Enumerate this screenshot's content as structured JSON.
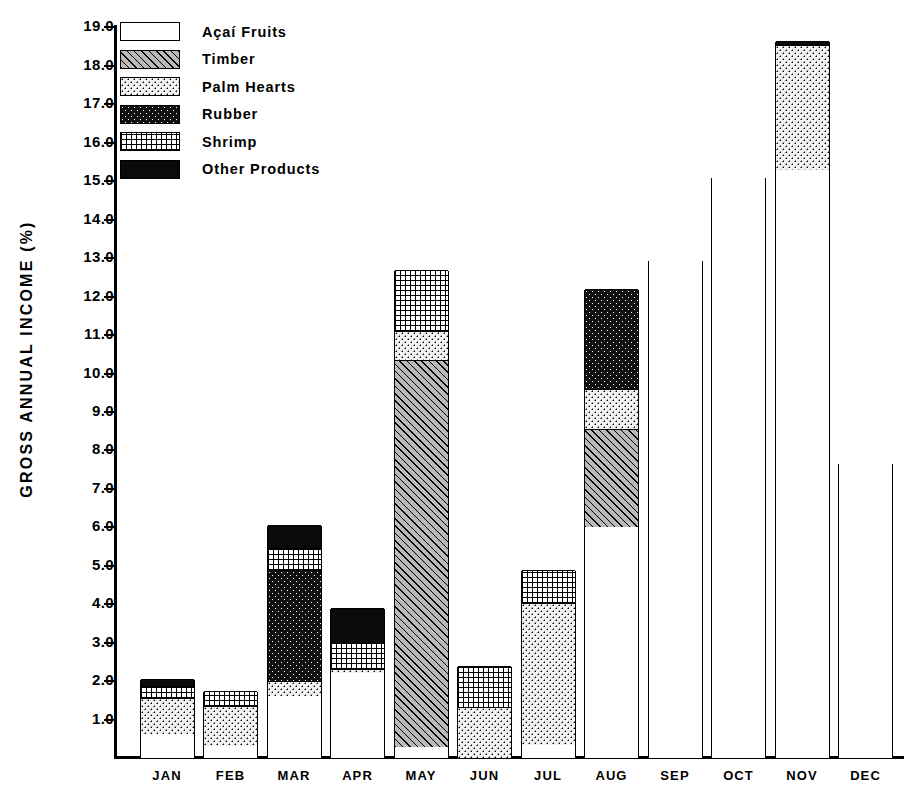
{
  "chart_data": {
    "type": "bar",
    "subtype": "stacked-bar",
    "title": "",
    "xlabel": "",
    "ylabel": "GROSS ANNUAL INCOME (%)",
    "ylim": [
      0,
      19.2
    ],
    "ytick_labels": [
      "19.0",
      "18.0",
      "17.0",
      "16.0",
      "15.0",
      "14.0",
      "13.0",
      "12.0",
      "11.0",
      "10.0",
      "9.0",
      "8.0",
      "7.0",
      "6.0",
      "5.0",
      "4.0",
      "3.0",
      "2.0",
      "1.0"
    ],
    "ytick_values": [
      19.0,
      18.0,
      17.0,
      16.0,
      15.0,
      14.0,
      13.0,
      12.0,
      11.0,
      10.0,
      9.0,
      8.0,
      7.0,
      6.0,
      5.0,
      4.0,
      3.0,
      2.0,
      1.0
    ],
    "grid": false,
    "legend_position": "upper-left-inside",
    "categories": [
      "JAN",
      "FEB",
      "MAR",
      "APR",
      "MAY",
      "JUN",
      "JUL",
      "AUG",
      "SEP",
      "OCT",
      "NOV",
      "DEC"
    ],
    "series": [
      {
        "name": "Açaí Fruits",
        "pattern": "open-white",
        "values": [
          0.62,
          0.3,
          1.6,
          2.2,
          0.28,
          0.0,
          0.35,
          6.0,
          12.95,
          15.1,
          15.3,
          7.68
        ]
      },
      {
        "name": "Timber",
        "pattern": "diagonal-hatch",
        "values": [
          0.0,
          0.0,
          0.0,
          0.0,
          10.07,
          0.0,
          0.0,
          2.55,
          0.0,
          0.0,
          0.0,
          0.0
        ]
      },
      {
        "name": "Palm Hearts",
        "pattern": "light-dots",
        "values": [
          0.95,
          1.05,
          0.4,
          0.12,
          0.75,
          1.3,
          3.67,
          1.05,
          0.0,
          0.0,
          3.25,
          0.0
        ]
      },
      {
        "name": "Rubber",
        "pattern": "dark-dots",
        "values": [
          0.0,
          0.0,
          2.9,
          0.0,
          0.0,
          0.0,
          0.0,
          2.6,
          0.0,
          0.0,
          0.0,
          0.0
        ]
      },
      {
        "name": "Shrimp",
        "pattern": "fine-grid",
        "values": [
          0.3,
          0.4,
          0.55,
          0.68,
          1.6,
          1.1,
          0.88,
          0.0,
          0.0,
          0.0,
          0.0,
          0.0
        ]
      },
      {
        "name": "Other Products",
        "pattern": "solid-black",
        "values": [
          0.18,
          0.0,
          0.6,
          0.9,
          0.0,
          0.0,
          0.0,
          0.0,
          0.0,
          0.0,
          0.1,
          0.0
        ]
      }
    ],
    "totals": [
      2.05,
      1.75,
      6.05,
      3.9,
      12.7,
      2.4,
      4.9,
      12.2,
      12.95,
      15.1,
      18.65,
      7.68
    ]
  },
  "legend": {
    "items": [
      {
        "label": "Açaí Fruits"
      },
      {
        "label": "Timber"
      },
      {
        "label": "Palm Hearts"
      },
      {
        "label": "Rubber"
      },
      {
        "label": "Shrimp"
      },
      {
        "label": "Other Products"
      }
    ]
  },
  "colors": {
    "foreground": "#000000",
    "background": "#ffffff",
    "timber_fill": "#b9b9b9",
    "palm_fill": "#f2f2f2",
    "rubber_fill": "#111111",
    "other_fill": "#0a0a0a"
  }
}
